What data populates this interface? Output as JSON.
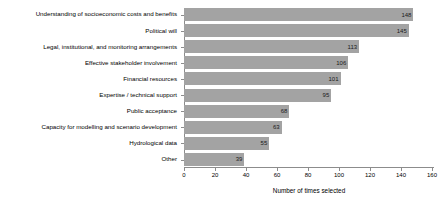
{
  "chart_data": {
    "type": "bar",
    "orientation": "horizontal",
    "title": "",
    "subtitle": "",
    "xlabel": "Number of times selected",
    "ylabel": "",
    "xlim": [
      0,
      160
    ],
    "xticks": [
      0,
      20,
      40,
      60,
      80,
      100,
      120,
      140,
      160
    ],
    "grid": false,
    "legend": null,
    "bar_color": "#a3a3a3",
    "axis_color": "#8c8c8c",
    "categories": [
      "Understanding of socioeconomic costs and benefits",
      "Political will",
      "Legal, institutional, and monitoring arrangements",
      "Effective stakeholder involvement",
      "Financial resources",
      "Expertise / technical support",
      "Public acceptance",
      "Capacity for modelling and scenario development",
      "Hydrological data",
      "Other"
    ],
    "values": [
      148,
      145,
      113,
      106,
      101,
      95,
      68,
      63,
      55,
      39
    ],
    "value_labels": [
      "148",
      "145",
      "113",
      "106",
      "101",
      "95",
      "68",
      "63",
      "55",
      "39"
    ]
  }
}
